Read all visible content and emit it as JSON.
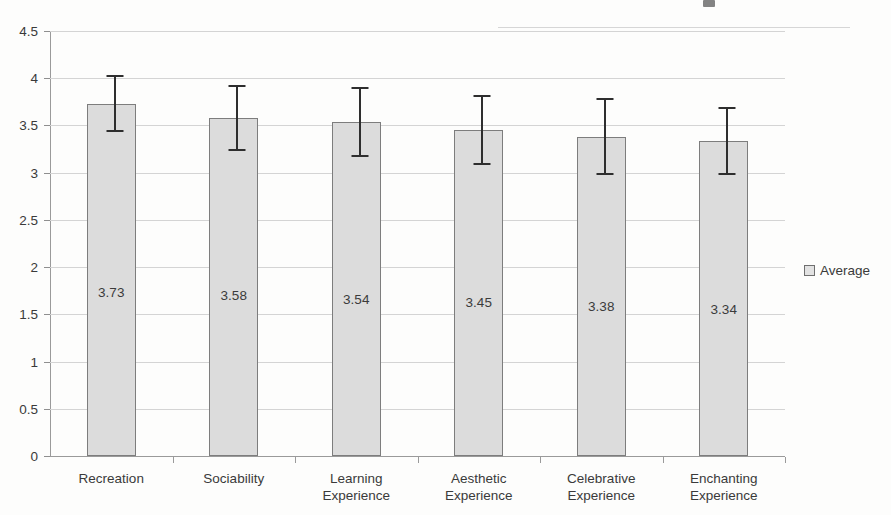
{
  "chart_data": {
    "type": "bar",
    "title": "",
    "xlabel": "",
    "ylabel": "",
    "categories": [
      "Recreation",
      "Sociability",
      "Learning Experience",
      "Aesthetic Experience",
      "Celebrative Experience",
      "Enchanting Experience"
    ],
    "category_lines": [
      [
        "Recreation",
        ""
      ],
      [
        "Sociability",
        ""
      ],
      [
        "Learning",
        "Experience"
      ],
      [
        "Aesthetic",
        "Experience"
      ],
      [
        "Celebrative",
        "Experience"
      ],
      [
        "Enchanting",
        "Experience"
      ]
    ],
    "series": [
      {
        "name": "Average",
        "values": [
          3.73,
          3.58,
          3.54,
          3.45,
          3.38,
          3.34
        ],
        "value_labels": [
          "3.73",
          "3.58",
          "3.54",
          "3.45",
          "3.38",
          "3.34"
        ],
        "errors": [
          0.3,
          0.35,
          0.37,
          0.37,
          0.41,
          0.36
        ]
      }
    ],
    "ylim": [
      0,
      4.5
    ],
    "ytick_values": [
      0,
      0.5,
      1,
      1.5,
      2,
      2.5,
      3,
      3.5,
      4,
      4.5
    ],
    "ytick_labels": [
      "0",
      "0.5",
      "1",
      "1.5",
      "2",
      "2.5",
      "3",
      "3.5",
      "4",
      "4.5"
    ],
    "grid": true,
    "legend": {
      "position": "right",
      "entries": [
        "Average"
      ]
    },
    "error_bar_style": "capped-vertical",
    "colors": {
      "bar_fill": "#dcdcdc",
      "bar_border": "#7d7d7d",
      "gridline": "#d4d4d4",
      "axis": "#9a9a9a",
      "error_bar": "#2e2e2e",
      "text": "#3a3a3a",
      "background": "#fdfdfc"
    }
  },
  "legend": {
    "average_label": "Average"
  }
}
